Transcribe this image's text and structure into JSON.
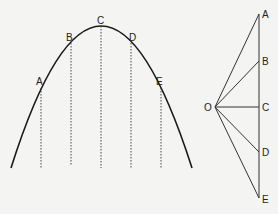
{
  "figure": {
    "parabola": {
      "points": [
        {
          "label": "A",
          "x": 41,
          "y": 88
        },
        {
          "label": "B",
          "x": 71,
          "y": 43
        },
        {
          "label": "C",
          "x": 101,
          "y": 26
        },
        {
          "label": "D",
          "x": 131,
          "y": 43
        },
        {
          "label": "E",
          "x": 161,
          "y": 88
        }
      ]
    },
    "polygon": {
      "pole_label": "O",
      "points": [
        {
          "label": "A"
        },
        {
          "label": "B"
        },
        {
          "label": "C"
        },
        {
          "label": "D"
        },
        {
          "label": "E"
        }
      ]
    }
  }
}
